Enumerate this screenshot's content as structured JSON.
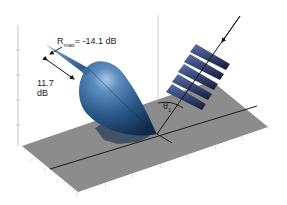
{
  "figure": {
    "type": "3d-scattering-pattern",
    "colors": {
      "lobe": "#2b5a8a",
      "lobe_highlight": "#8fb4d8",
      "lobe_shadow": "#0f2a48",
      "floor": "#8a8a8a",
      "wavefront": "#1e2c5a",
      "axis": "#bdbdbd",
      "line": "#111111"
    },
    "annotations": {
      "rmax_symbol": "R",
      "rmax_sub": "max",
      "rmax_value": "= -14.1 dB",
      "level_value": "11.7",
      "level_unit": "dB",
      "theta_symbol": "θ",
      "theta_sub": "1"
    },
    "wavefront_count": 5
  }
}
